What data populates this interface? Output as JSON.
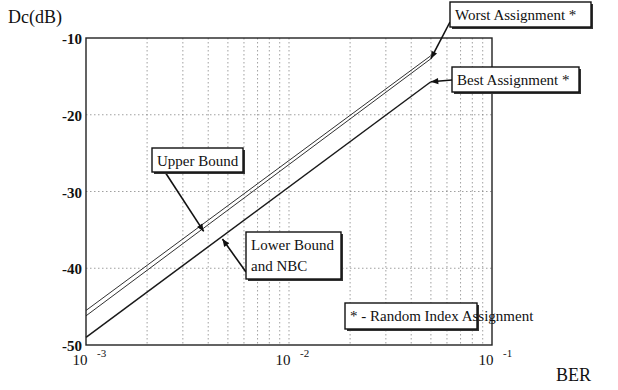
{
  "chart_data": {
    "type": "line",
    "title": "",
    "xlabel": "BER",
    "ylabel": "Dc(dB)",
    "xscale": "log",
    "xlim": [
      0.001,
      0.1
    ],
    "ylim": [
      -50,
      -10
    ],
    "grid": true,
    "x_ticks": [
      {
        "value": 0.001,
        "base": "10",
        "exp": "-3"
      },
      {
        "value": 0.01,
        "base": "10",
        "exp": "-2"
      },
      {
        "value": 0.1,
        "base": "10",
        "exp": "-1"
      }
    ],
    "y_ticks": [
      {
        "value": -10,
        "label": "-10"
      },
      {
        "value": -20,
        "label": "-20"
      },
      {
        "value": -30,
        "label": "-30"
      },
      {
        "value": -40,
        "label": "-40"
      },
      {
        "value": -50,
        "label": "-50"
      }
    ],
    "series": [
      {
        "name": "Upper Bound",
        "x": [
          0.001,
          0.05
        ],
        "y": [
          -45.5,
          -12.3
        ],
        "style": "thin"
      },
      {
        "name": "Worst Assignment *",
        "x": [
          0.001,
          0.05
        ],
        "y": [
          -46.2,
          -12.7
        ],
        "style": "thin"
      },
      {
        "name": "Best Assignment * / Lower Bound and NBC",
        "x": [
          0.001,
          0.05
        ],
        "y": [
          -49.0,
          -15.7
        ],
        "style": "thick"
      }
    ],
    "annotations": [
      {
        "text": [
          "Worst Assignment *"
        ],
        "points_to": {
          "x": 0.05,
          "y": -12.7
        }
      },
      {
        "text": [
          "Best Assignment *"
        ],
        "points_to": {
          "x": 0.05,
          "y": -15.7
        }
      },
      {
        "text": [
          "Upper Bound"
        ],
        "points_to": {
          "x": 0.0038,
          "y": -35.2
        }
      },
      {
        "text": [
          "Lower Bound",
          "and NBC"
        ],
        "points_to": {
          "x": 0.0047,
          "y": -36.2
        }
      },
      {
        "text": [
          "* - Random Index Assignment"
        ],
        "points_to": null
      }
    ]
  }
}
